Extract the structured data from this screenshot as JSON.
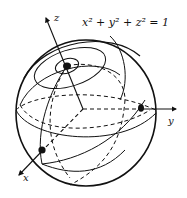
{
  "figure": {
    "equation": "x² + y² + z² = 1",
    "axes": {
      "z_label": "z",
      "y_label": "y",
      "x_label": "x"
    },
    "points": [
      {
        "name": "north-pole",
        "on_axis": "z"
      },
      {
        "name": "y-axis-point",
        "on_axis": "y"
      },
      {
        "name": "x-axis-point",
        "on_axis": "x"
      }
    ],
    "colors": {
      "stroke": "#111111",
      "background": "#ffffff"
    }
  }
}
